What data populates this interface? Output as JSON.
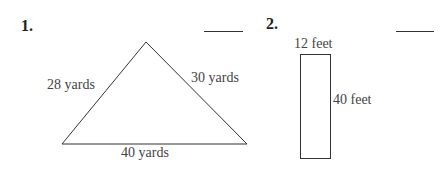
{
  "problems": [
    {
      "number": "1.",
      "shape": "triangle",
      "labels": {
        "left_side": "28 yards",
        "right_side": "30 yards",
        "base": "40 yards"
      },
      "answer": ""
    },
    {
      "number": "2.",
      "shape": "rectangle",
      "labels": {
        "width": "12 feet",
        "length": "40 feet"
      },
      "answer": ""
    }
  ]
}
